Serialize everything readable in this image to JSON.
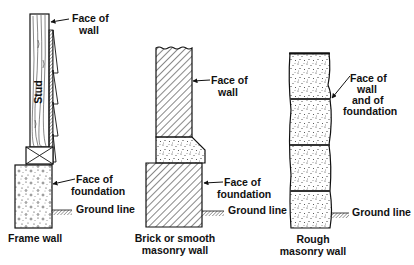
{
  "diagram": {
    "type": "wall-section-comparison",
    "panels": [
      {
        "id": "frame-wall",
        "caption": [
          "Frame wall"
        ],
        "components": [
          "stud",
          "sheathing",
          "siding",
          "sill plate",
          "concrete foundation",
          "ground"
        ],
        "stud_label": "Stud",
        "callouts": [
          {
            "lines": [
              "Face of",
              "wall"
            ]
          },
          {
            "lines": [
              "Face of",
              "foundation"
            ]
          },
          {
            "lines": [
              "Ground line"
            ]
          }
        ]
      },
      {
        "id": "brick-wall",
        "caption": [
          "Brick or smooth",
          "masonry wall"
        ],
        "components": [
          "brick wall",
          "concrete cap / water table",
          "brick foundation",
          "ground"
        ],
        "callouts": [
          {
            "lines": [
              "Face of",
              "wall"
            ]
          },
          {
            "lines": [
              "Face of",
              "foundation"
            ]
          },
          {
            "lines": [
              "Ground line"
            ]
          }
        ]
      },
      {
        "id": "rough-wall",
        "caption": [
          "Rough",
          "masonry wall"
        ],
        "components": [
          "rough stone courses",
          "mortar joints",
          "ground"
        ],
        "callouts": [
          {
            "lines": [
              "Face of",
              "wall",
              "and of",
              "foundation"
            ]
          },
          {
            "lines": [
              "Ground line"
            ]
          }
        ]
      }
    ],
    "colors": {
      "ink": "#111111",
      "background": "#ffffff"
    }
  }
}
